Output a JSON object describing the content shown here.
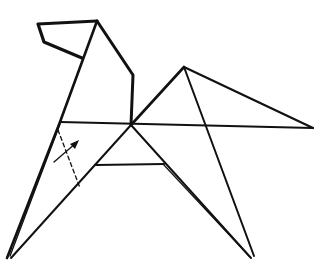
{
  "diagram": {
    "title": "",
    "stroke_color": "#111111",
    "background": "#ffffff",
    "annotations": [
      {
        "type": "fold-line",
        "style": "dashed",
        "from": [
          58,
          130
        ],
        "to": [
          80,
          188
        ]
      },
      {
        "type": "arrow",
        "direction": "up-right",
        "from": [
          54,
          162
        ],
        "to": [
          78,
          141
        ]
      }
    ]
  }
}
